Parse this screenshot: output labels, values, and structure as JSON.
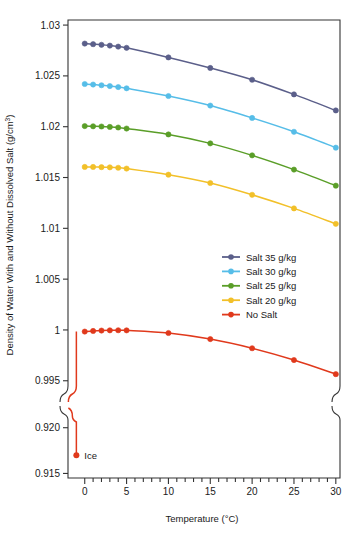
{
  "chart_data": {
    "type": "line",
    "title": "",
    "xlabel": "Temperature (°C)",
    "ylabel": "Density of Water With and Without Dissolved Salt (g/cm3)",
    "ylabel_text": "Density of Water With and Without Dissolved Salt (g/cm",
    "ylabel_sup": "3",
    "ylabel_tail": ")",
    "xlabel_text": "Temperature (°C)",
    "xlim": [
      -2,
      30.5
    ],
    "grid": false,
    "legend_position": "center-right",
    "axis_break": true,
    "panels": [
      {
        "name": "upper-panel",
        "ylim": [
          0.9935,
          1.0305
        ],
        "yticks": [
          1.03,
          1.025,
          1.02,
          1.015,
          1.01,
          1.005,
          1,
          0.995
        ],
        "ytick_labels": [
          "1.03",
          "1.025",
          "1.02",
          "1.015",
          "1.01",
          "1.005",
          "1",
          "0.995"
        ]
      },
      {
        "name": "lower-panel",
        "ylim": [
          0.9145,
          0.9215
        ],
        "yticks": [
          0.92,
          0.915
        ],
        "ytick_labels": [
          "0.920",
          "0.915"
        ]
      }
    ],
    "xticks": [
      0,
      5,
      10,
      15,
      20,
      25,
      30
    ],
    "xtick_labels": [
      "0",
      "5",
      "10",
      "15",
      "20",
      "25",
      "30"
    ],
    "x": [
      0,
      1,
      2,
      3,
      4,
      5,
      10,
      15,
      20,
      25,
      30
    ],
    "series": [
      {
        "name": "Salt 35 g/kg",
        "color": "#5b5f8a",
        "values": [
          1.02818,
          1.02812,
          1.02806,
          1.02798,
          1.02788,
          1.02776,
          1.02682,
          1.02578,
          1.02462,
          1.02318,
          1.0216
        ]
      },
      {
        "name": "Salt 30 g/kg",
        "color": "#56bde8",
        "values": [
          1.0242,
          1.02415,
          1.02408,
          1.024,
          1.0239,
          1.02378,
          1.02302,
          1.02208,
          1.02086,
          1.0195,
          1.01794
        ]
      },
      {
        "name": "Salt 25 g/kg",
        "color": "#5a9e28",
        "values": [
          1.02006,
          1.02004,
          1.02002,
          1.01998,
          1.01992,
          1.01982,
          1.01924,
          1.01836,
          1.01718,
          1.01578,
          1.0142
        ]
      },
      {
        "name": "Salt 20 g/kg",
        "color": "#f2c029",
        "values": [
          1.01604,
          1.01604,
          1.01602,
          1.016,
          1.01596,
          1.01588,
          1.01528,
          1.01446,
          1.0133,
          1.01196,
          1.01044
        ]
      },
      {
        "name": "No Salt",
        "color": "#e0391c",
        "values": [
          0.99984,
          0.9999,
          0.99994,
          0.99996,
          0.99997,
          0.99996,
          0.9997,
          0.9991,
          0.9982,
          0.99704,
          0.99565
        ]
      }
    ],
    "annotations": [
      {
        "name": "ice-point",
        "label": "Ice",
        "x": -1,
        "y": 0.917,
        "color": "#e0391c"
      }
    ],
    "ice_drop": {
      "name": "ice-transition-line",
      "from_x": -1,
      "from_y": 0.99984,
      "to_y": 0.917,
      "color": "#e0391c"
    },
    "legend": [
      {
        "label": "Salt 35 g/kg",
        "color": "#5b5f8a"
      },
      {
        "label": "Salt 30 g/kg",
        "color": "#56bde8"
      },
      {
        "label": "Salt 25 g/kg",
        "color": "#5a9e28"
      },
      {
        "label": "Salt 20 g/kg",
        "color": "#f2c029"
      },
      {
        "label": "No Salt",
        "color": "#e0391c"
      }
    ]
  },
  "axes": {
    "y_tick_labels_upper": [
      "1.03",
      "1.025",
      "1.02",
      "1.015",
      "1.01",
      "1.005",
      "1",
      "0.995"
    ],
    "y_tick_labels_lower": [
      "0.920",
      "0.915"
    ],
    "x_tick_labels": [
      "0",
      "5",
      "10",
      "15",
      "20",
      "25",
      "30"
    ],
    "x_title": "Temperature (°C)",
    "y_title_main": "Density of Water With and Without Dissolved Salt (g/cm",
    "y_title_sup": "3",
    "y_title_close": ")"
  },
  "labels": {
    "ice": "Ice"
  }
}
